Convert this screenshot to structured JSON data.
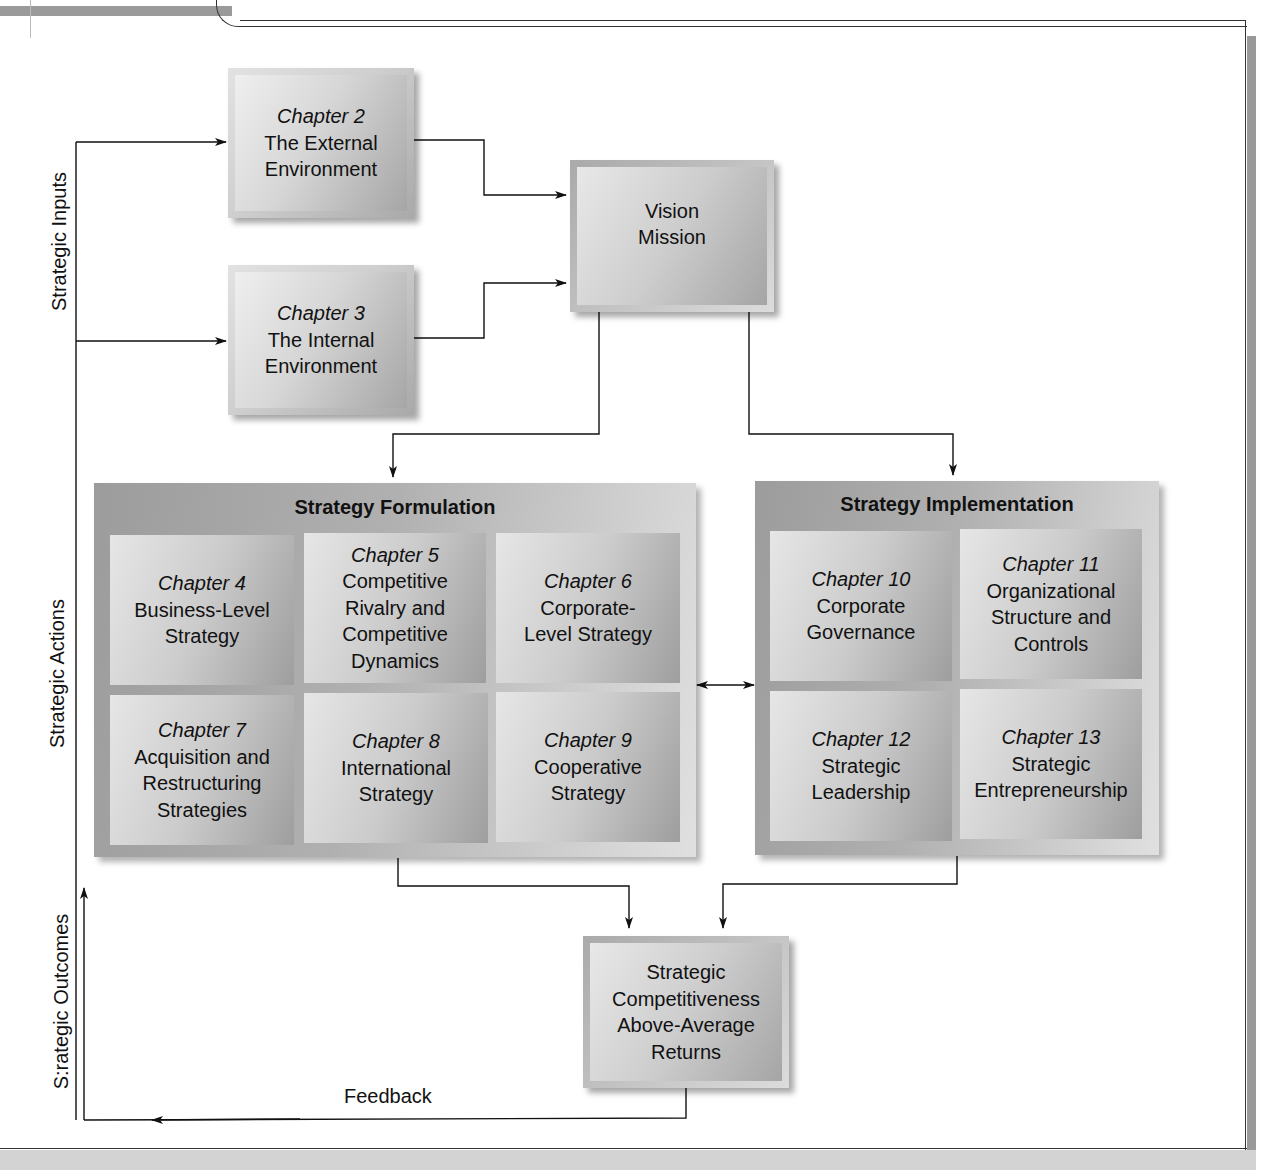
{
  "side_labels": {
    "inputs": "Strategic Inputs",
    "actions": "Strategic Actions",
    "outcomes": "S:rategic Outcomes"
  },
  "inputs": [
    {
      "chapter": "Chapter 2",
      "title_lines": [
        "The External",
        "Environment"
      ]
    },
    {
      "chapter": "Chapter 3",
      "title_lines": [
        "The Internal",
        "Environment"
      ]
    }
  ],
  "vision": {
    "lines": [
      "Vision",
      "Mission"
    ]
  },
  "formulation": {
    "title": "Strategy Formulation",
    "cells": [
      {
        "chapter": "Chapter 4",
        "lines": [
          "Business-Level",
          "Strategy"
        ]
      },
      {
        "chapter": "Chapter 5",
        "lines": [
          "Competitive",
          "Rivalry and",
          "Competitive",
          "Dynamics"
        ]
      },
      {
        "chapter": "Chapter 6",
        "lines": [
          "Corporate-",
          "Level Strategy"
        ]
      },
      {
        "chapter": "Chapter 7",
        "lines": [
          "Acquisition and",
          "Restructuring",
          "Strategies"
        ]
      },
      {
        "chapter": "Chapter 8",
        "lines": [
          "International",
          "Strategy"
        ]
      },
      {
        "chapter": "Chapter 9",
        "lines": [
          "Cooperative",
          "Strategy"
        ]
      }
    ]
  },
  "implementation": {
    "title": "Strategy Implementation",
    "cells": [
      {
        "chapter": "Chapter 10",
        "lines": [
          "Corporate",
          "Governance"
        ]
      },
      {
        "chapter": "Chapter 11",
        "lines": [
          "Organizational",
          "Structure and",
          "Controls"
        ]
      },
      {
        "chapter": "Chapter 12",
        "lines": [
          "Strategic",
          "Leadership"
        ]
      },
      {
        "chapter": "Chapter 13",
        "lines": [
          "Strategic",
          "Entrepreneurship"
        ]
      }
    ]
  },
  "outcome": {
    "lines": [
      "Strategic",
      "Competitiveness",
      "Above-Average",
      "Returns"
    ]
  },
  "feedback_label": "Feedback"
}
